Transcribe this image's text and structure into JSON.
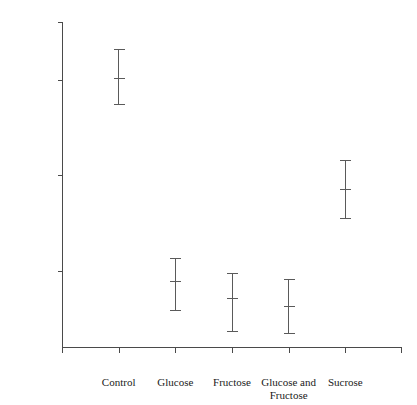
{
  "chart_data": {
    "type": "scatter",
    "title": "",
    "xlabel": "",
    "ylabel": "Y (Length in ocular units)",
    "ylabel_italic_prefix": "Y",
    "ylabel_rest": " (Length in ocular units)",
    "ylim": [
      56,
      73
    ],
    "yticks": [
      56,
      57,
      58,
      59,
      60,
      61,
      62,
      63,
      64,
      65,
      66,
      67,
      68,
      69,
      70,
      71,
      72,
      73
    ],
    "ytick_labels": [
      "56",
      "57",
      "58",
      "59",
      "60",
      "61",
      "62",
      "63",
      "64",
      "65",
      "66",
      "67",
      "68",
      "69",
      "70",
      "71",
      "72",
      "73"
    ],
    "major_ticks": [
      60,
      65,
      70,
      73
    ],
    "grid": false,
    "legend": null,
    "categories": [
      "Control",
      "Glucose",
      "Fructose",
      "Glucose and Fructose",
      "Sucrose"
    ],
    "category_label_lines": [
      [
        "Control"
      ],
      [
        "Glucose"
      ],
      [
        "Fructose"
      ],
      [
        "Glucose and",
        "Fructose"
      ],
      [
        "Sucrose"
      ]
    ],
    "series": [
      {
        "name": "Mean length with error bars",
        "means": [
          70.1,
          59.5,
          58.6,
          58.2,
          64.3
        ],
        "lower": [
          68.7,
          58.0,
          56.9,
          56.8,
          62.8
        ],
        "upper": [
          71.6,
          60.7,
          59.9,
          59.6,
          65.8
        ]
      }
    ],
    "points": [
      {
        "category": "Control",
        "mean": 70.1,
        "lower": 68.7,
        "upper": 71.6
      },
      {
        "category": "Glucose",
        "mean": 59.5,
        "lower": 58.0,
        "upper": 60.7
      },
      {
        "category": "Fructose",
        "mean": 58.6,
        "lower": 56.9,
        "upper": 59.9
      },
      {
        "category": "Glucose and Fructose",
        "mean": 58.2,
        "lower": 56.8,
        "upper": 59.6
      },
      {
        "category": "Sucrose",
        "mean": 64.3,
        "lower": 62.8,
        "upper": 65.8
      }
    ],
    "colors": {
      "axis": "#4a4a4a",
      "errorbar": "#5a5a5a",
      "background": "#ffffff",
      "text": "#1a1a1a"
    }
  }
}
